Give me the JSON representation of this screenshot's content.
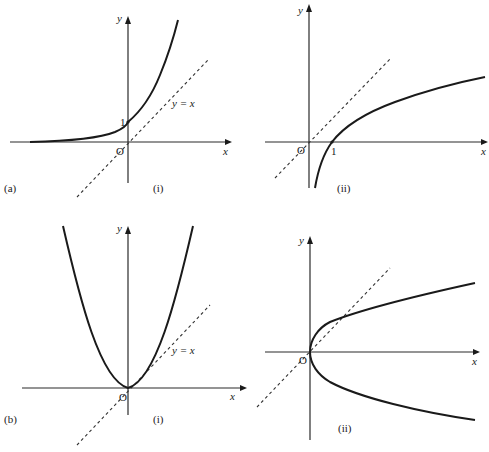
{
  "figure": {
    "panels": [
      {
        "id": "a-i",
        "group_label": "(a)",
        "sub_label": "(i)",
        "axis_x_label": "x",
        "axis_y_label": "y",
        "origin_label": "O",
        "intercept_label": "1",
        "line_label": "y = x",
        "curve": "exponential (y = e^x type), passes through (0,1)"
      },
      {
        "id": "a-ii",
        "group_label": "",
        "sub_label": "(ii)",
        "axis_x_label": "x",
        "axis_y_label": "y",
        "origin_label": "O",
        "intercept_label": "1",
        "line_label": "",
        "curve": "logarithmic (y = ln x type), passes through (1,0)"
      },
      {
        "id": "b-i",
        "group_label": "(b)",
        "sub_label": "(i)",
        "axis_x_label": "x",
        "axis_y_label": "y",
        "origin_label": "O",
        "line_label": "y = x",
        "curve": "parabola y = x^2, vertex at origin"
      },
      {
        "id": "b-ii",
        "group_label": "",
        "sub_label": "(ii)",
        "axis_x_label": "x",
        "axis_y_label": "y",
        "origin_label": "O",
        "line_label": "",
        "curve": "sideways parabola x = y^2, vertex at origin"
      }
    ],
    "colors": {
      "ink": "#1a1a1a",
      "background": "#ffffff"
    }
  }
}
